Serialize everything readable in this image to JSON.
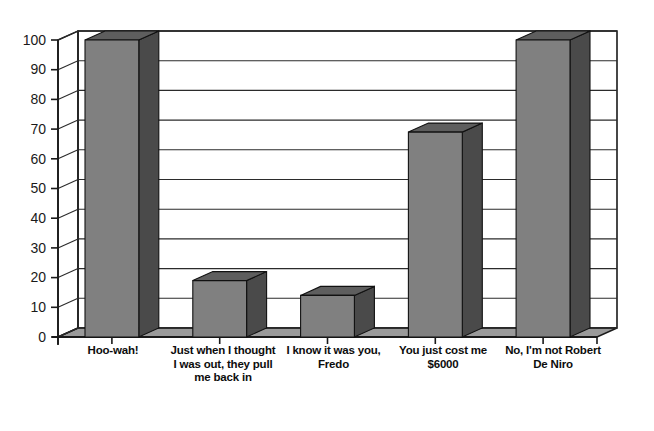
{
  "chart_data": {
    "type": "bar",
    "title": "",
    "subtitle": "",
    "xlabel": "",
    "ylabel": "",
    "categories": [
      "Hoo-wah!",
      "Just when I thought I was out, they pull me back in",
      "I know it was you, Fredo",
      "You just cost me $6000",
      "No, I'm not Robert De Niro"
    ],
    "values": [
      100,
      19,
      14,
      69,
      100
    ],
    "ylim": [
      0,
      100
    ],
    "yticks": [
      0,
      10,
      20,
      30,
      40,
      50,
      60,
      70,
      80,
      90,
      100
    ],
    "ytick_labels": [
      "0",
      "10",
      "20",
      "30",
      "40",
      "50",
      "60",
      "70",
      "80",
      "90",
      "100"
    ],
    "grid": true,
    "legend": "none",
    "style": "3d-column",
    "colors": {
      "bar_front": "#808080",
      "bar_side": "#4a4a4a",
      "bar_top": "#5e5e5e",
      "floor": "#9a9a9a",
      "floor_side": "#6e6e6e",
      "back_wall": "#ffffff",
      "axis_line": "#1a1a1a",
      "grid_line": "#2b2b2b",
      "tick_text": "#1a1a1a",
      "label_text": "#0d0d0d",
      "background": "#ffffff"
    }
  },
  "axis": {
    "y_tick_labels": [
      "100",
      "90",
      "80",
      "70",
      "60",
      "50",
      "40",
      "30",
      "20",
      "10",
      "0"
    ],
    "category_labels": [
      "Hoo-wah!",
      "Just when I thought I was out, they pull me back in",
      "I know it was you, Fredo",
      "You just cost me $6000",
      "No, I'm not Robert De Niro"
    ]
  }
}
